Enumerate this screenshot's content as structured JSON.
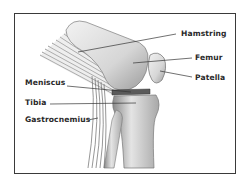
{
  "diagram": {
    "labels": [
      {
        "id": "hamstring",
        "text": "Hamstring"
      },
      {
        "id": "femur",
        "text": "Femur"
      },
      {
        "id": "patella",
        "text": "Patella"
      },
      {
        "id": "meniscus",
        "text": "Meniscus"
      },
      {
        "id": "tibia",
        "text": "Tibia"
      },
      {
        "id": "gastrocnemius",
        "text": "Gastrocnemius"
      }
    ]
  },
  "colors": {
    "frame": "#3a3a3a",
    "label_text": "#2a2a2a",
    "leader_line": "#333333",
    "bone_light": "#e8e8e8",
    "bone_shade": "#9a9a9a"
  }
}
